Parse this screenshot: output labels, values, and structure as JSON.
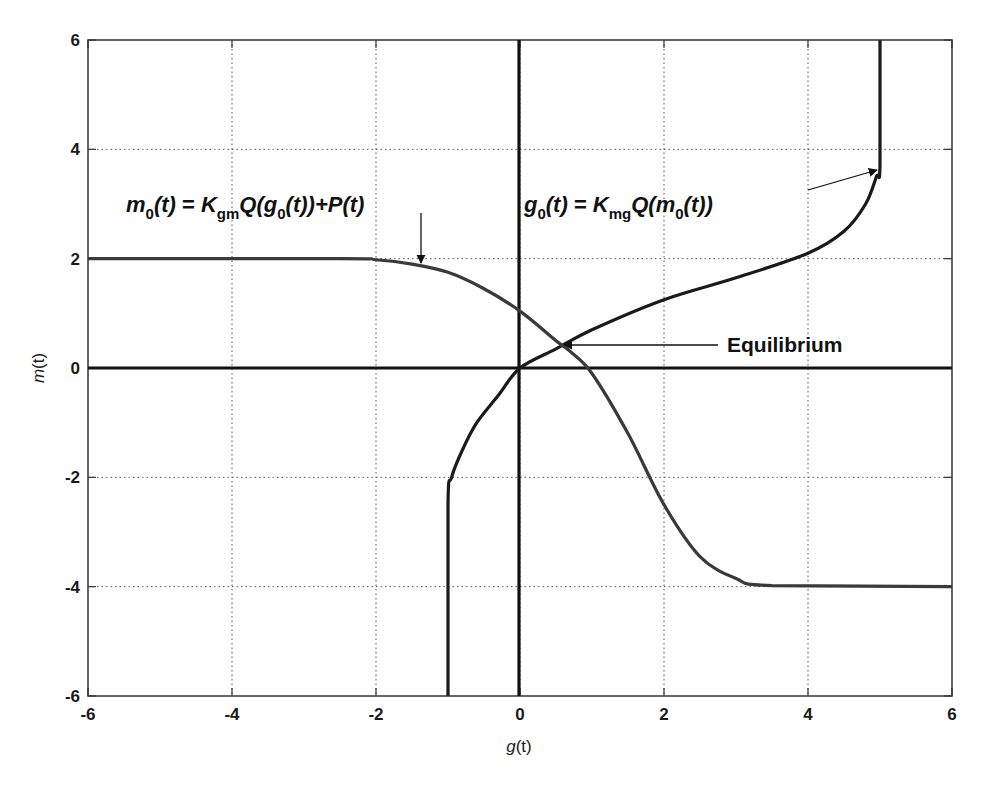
{
  "chart_data": {
    "type": "line",
    "title": "",
    "xlabel": "g(t)",
    "ylabel": "m(t)",
    "xlim": [
      -6,
      6
    ],
    "ylim": [
      -6,
      6
    ],
    "xticks": [
      -6,
      -4,
      -2,
      0,
      2,
      4,
      6
    ],
    "yticks": [
      -6,
      -4,
      -2,
      0,
      2,
      4,
      6
    ],
    "grid": true,
    "legend": null,
    "series": [
      {
        "name": "g0(t) = Kmg Q(m0(t))",
        "x": [
          -1,
          -1,
          -0.95,
          -0.8,
          -0.6,
          -0.3,
          0,
          0.5,
          1,
          2,
          3,
          4,
          4.5,
          4.8,
          4.95,
          5,
          5
        ],
        "y": [
          -6,
          -2.5,
          -2,
          -1.5,
          -1,
          -0.5,
          0,
          0.35,
          0.7,
          1.25,
          1.65,
          2.1,
          2.5,
          3,
          3.5,
          3.7,
          6
        ]
      },
      {
        "name": "m0(t) = Kgm Q(g0(t)) + P(t)",
        "x": [
          -6,
          -2.5,
          -2,
          -1.5,
          -1,
          -0.5,
          0,
          0.5,
          0.7,
          1,
          1.5,
          2,
          2.5,
          3,
          3.5,
          6
        ],
        "y": [
          2,
          2,
          1.98,
          1.9,
          1.75,
          1.45,
          1.04,
          0.5,
          0.3,
          -0.1,
          -1.2,
          -2.5,
          -3.45,
          -3.85,
          -3.98,
          -4
        ]
      }
    ],
    "annotations": [
      {
        "text": "Equilibrium",
        "point": [
          0.62,
          0.4
        ],
        "label_at": [
          2.8,
          0.4
        ]
      },
      {
        "text": "m0(t) = Kgm Q(g0(t)) + P(t)",
        "arrow_to": [
          -1.3,
          1.85
        ]
      },
      {
        "text": "g0(t) = Kmg Q(m0(t))",
        "arrow_to": [
          5,
          3.6
        ]
      }
    ],
    "axes_lines": {
      "x_zero": true,
      "y_zero": true
    }
  },
  "labels": {
    "xlabel_var": "g",
    "xlabel_arg": "(t)",
    "ylabel_var": "m",
    "ylabel_arg": "(t)",
    "equilibrium": "Equilibrium",
    "eq1": {
      "lhs_var": "m",
      "lhs_sub": "0",
      "lhs_arg": "(t)",
      "eqs": " = ",
      "k": "K",
      "k_sub": "gm",
      "q_open": "Q(",
      "g": "g",
      "g_sub": "0",
      "tail": "(t))+",
      "p": "P",
      "p_arg": "(t)"
    },
    "eq2": {
      "lhs_var": "g",
      "lhs_sub": "0",
      "lhs_arg": "(t)",
      "eqs": " = ",
      "k": "K",
      "k_sub": "mg",
      "q_open": "Q(",
      "m": "m",
      "m_sub": "0",
      "tail": "(t))"
    }
  },
  "ticks": {
    "x": [
      "-6",
      "-4",
      "-2",
      "0",
      "2",
      "4",
      "6"
    ],
    "y": [
      "6",
      "4",
      "2",
      "0",
      "-2",
      "-4",
      "-6"
    ]
  }
}
